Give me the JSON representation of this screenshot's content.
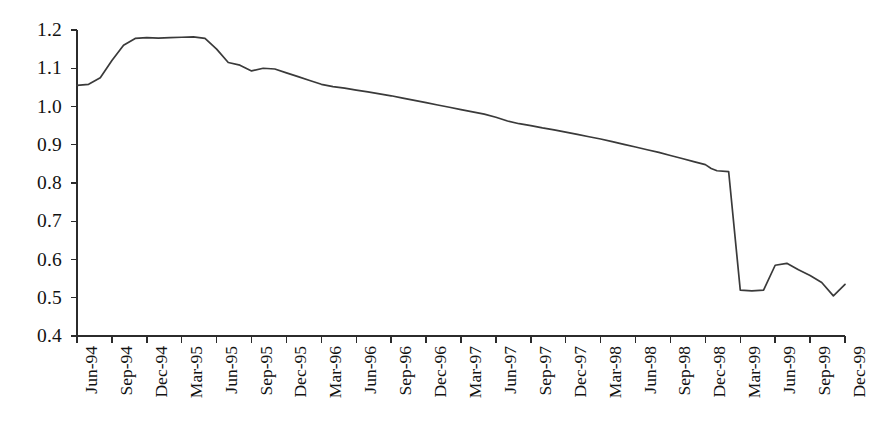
{
  "chart_data": {
    "type": "line",
    "title": "",
    "subtitle": "",
    "xlabel": "",
    "ylabel": "",
    "ylim": [
      0.4,
      1.2
    ],
    "ytick_labels": [
      "1.2",
      "1.1",
      "1.0",
      "0.9",
      "0.8",
      "0.7",
      "0.6",
      "0.5",
      "0.4"
    ],
    "ytick_values": [
      1.2,
      1.1,
      1.0,
      0.9,
      0.8,
      0.7,
      0.6,
      0.5,
      0.4
    ],
    "grid": false,
    "legend": false,
    "legend_position": "none",
    "line_color": "#3a3a3a",
    "background_color": "#ffffff",
    "axis_color": "#2b2b2b",
    "categories": [
      "Jun-94",
      "Sep-94",
      "Dec-94",
      "Mar-95",
      "Jun-95",
      "Sep-95",
      "Dec-95",
      "Mar-96",
      "Jun-96",
      "Sep-96",
      "Dec-96",
      "Mar-97",
      "Jun-97",
      "Sep-97",
      "Dec-97",
      "Mar-98",
      "Jun-98",
      "Sep-98",
      "Dec-98",
      "Mar-99",
      "Jun-99",
      "Sep-99",
      "Dec-99"
    ],
    "x_tick_count": 23,
    "x_tick_interval": "quarterly",
    "series": [
      {
        "name": "index",
        "point_interval": "monthly",
        "x": [
          0.0,
          0.333,
          0.667,
          1.0,
          1.333,
          1.667,
          2.0,
          2.333,
          2.667,
          3.0,
          3.333,
          3.667,
          4.0,
          4.333,
          4.667,
          5.0,
          5.333,
          5.667,
          6.0,
          6.333,
          6.667,
          7.0,
          7.333,
          7.667,
          8.0,
          8.333,
          8.667,
          9.0,
          9.333,
          9.667,
          10.0,
          10.333,
          10.667,
          11.0,
          11.333,
          11.667,
          12.0,
          12.333,
          12.667,
          13.0,
          13.333,
          13.667,
          14.0,
          14.333,
          14.667,
          15.0,
          15.333,
          15.667,
          16.0,
          16.333,
          16.667,
          17.0,
          17.333,
          17.667,
          18.0,
          18.167,
          18.333,
          18.667,
          19.0,
          19.333,
          19.667,
          20.0,
          20.333,
          20.667,
          21.0,
          21.333,
          21.667,
          22.0
        ],
        "values": [
          1.055,
          1.058,
          1.075,
          1.12,
          1.16,
          1.178,
          1.18,
          1.179,
          1.18,
          1.181,
          1.182,
          1.178,
          1.15,
          1.115,
          1.108,
          1.093,
          1.1,
          1.098,
          1.088,
          1.078,
          1.068,
          1.058,
          1.052,
          1.048,
          1.043,
          1.038,
          1.033,
          1.028,
          1.022,
          1.016,
          1.01,
          1.004,
          0.998,
          0.992,
          0.986,
          0.98,
          0.972,
          0.962,
          0.955,
          0.95,
          0.944,
          0.939,
          0.933,
          0.927,
          0.921,
          0.915,
          0.908,
          0.901,
          0.894,
          0.887,
          0.88,
          0.872,
          0.864,
          0.856,
          0.848,
          0.838,
          0.832,
          0.83,
          0.52,
          0.518,
          0.52,
          0.585,
          0.59,
          0.573,
          0.558,
          0.54,
          0.505,
          0.535
        ]
      }
    ]
  }
}
